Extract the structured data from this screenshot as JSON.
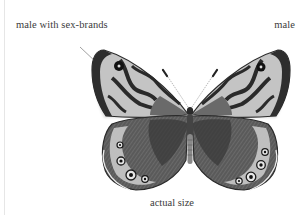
{
  "figure": {
    "labels": {
      "left": "male with sex-brands",
      "right": "male"
    },
    "caption": "actual size",
    "colors": {
      "wing_dark": "#2a2a2a",
      "wing_mid": "#6e6e6e",
      "wing_light": "#bdbdbd",
      "wing_pale": "#dedede",
      "leader_line": "#777777",
      "text": "#3b3b3b"
    }
  }
}
